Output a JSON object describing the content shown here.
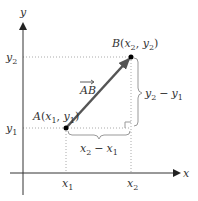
{
  "diagram": {
    "axes": {
      "x_label": "x",
      "y_label": "y"
    },
    "points": {
      "A": {
        "name": "A",
        "x_sub": "1",
        "y_sub": "1",
        "label": "A(x1, y1)"
      },
      "B": {
        "name": "B",
        "x_sub": "2",
        "y_sub": "2",
        "label": "B(x2, y2)"
      }
    },
    "vector": {
      "label": "AB",
      "color": "#555555"
    },
    "ticks": {
      "x1": {
        "base": "x",
        "sub": "1"
      },
      "x2": {
        "base": "x",
        "sub": "2"
      },
      "y1": {
        "base": "y",
        "sub": "1"
      },
      "y2": {
        "base": "y",
        "sub": "2"
      }
    },
    "braces": {
      "horizontal": {
        "label": "x2 − x1",
        "a": "x",
        "a_sub": "2",
        "op": "−",
        "b": "x",
        "b_sub": "1"
      },
      "vertical": {
        "label": "y2 − y1",
        "a": "y",
        "a_sub": "2",
        "op": "−",
        "b": "y",
        "b_sub": "1"
      }
    },
    "colors": {
      "axis": "#333333",
      "dotted": "#aaaaaa",
      "brace": "#999999",
      "point": "#000000",
      "vector": "#555555"
    }
  }
}
